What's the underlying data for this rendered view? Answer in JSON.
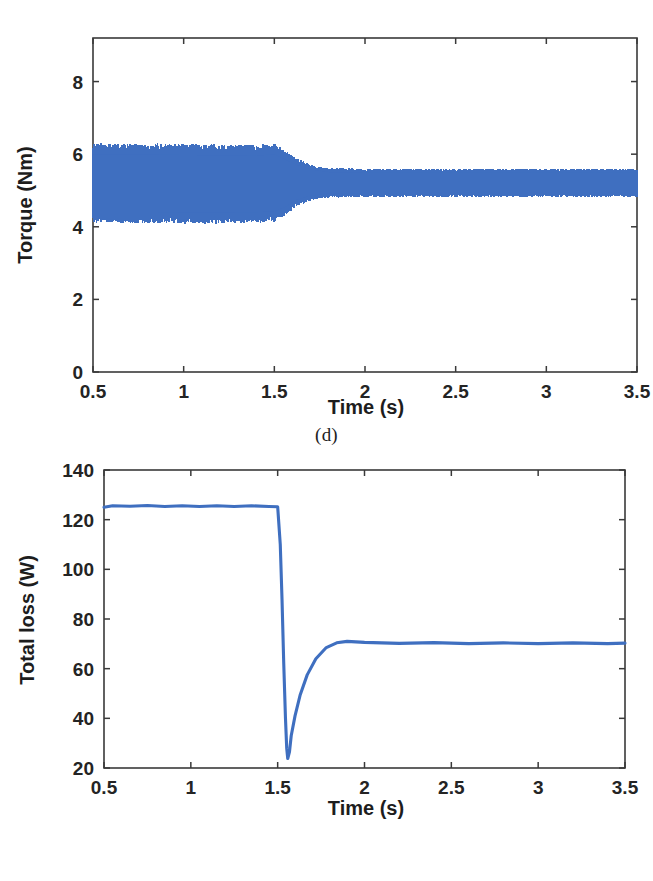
{
  "figure": {
    "background": "#ffffff",
    "series_color": "#3f6fc0",
    "axis_color": "#3a3a3a",
    "panels": [
      {
        "id": "d",
        "caption": "(d)"
      },
      {
        "id": "e",
        "caption": "(e)"
      }
    ]
  },
  "chart_data": [
    {
      "type": "line",
      "id": "torque-vs-time",
      "caption": "(d)",
      "title": "",
      "xlabel": "Time (s)",
      "ylabel": "Torque (Nm)",
      "xlim": [
        0.5,
        3.5
      ],
      "ylim": [
        0,
        9.2
      ],
      "xticks": [
        0.5,
        1,
        1.5,
        2,
        2.5,
        3,
        3.5
      ],
      "xticklabels": [
        "0.5",
        "1",
        "1.5",
        "2",
        "2.5",
        "3",
        "3.5"
      ],
      "yticks": [
        0,
        2,
        4,
        6,
        8
      ],
      "yticklabels": [
        "0",
        "2",
        "4",
        "6",
        "8"
      ],
      "grid": false,
      "legend": null,
      "description": "High-frequency torque ripple band. Before t=1.5 s the ripple spans about 4.1 to 6.3 Nm about a 5.2 Nm mean; after t=1.5 s the band contracts to roughly 4.8 to 5.6 Nm about a 5.2 Nm mean.",
      "series": [
        {
          "name": "Torque",
          "mean": 5.2,
          "envelope": [
            {
              "t": 0.5,
              "low": 4.1,
              "high": 6.3
            },
            {
              "t": 0.8,
              "low": 4.1,
              "high": 6.3
            },
            {
              "t": 1.1,
              "low": 4.08,
              "high": 6.28
            },
            {
              "t": 1.4,
              "low": 4.1,
              "high": 6.26
            },
            {
              "t": 1.5,
              "low": 4.12,
              "high": 6.3
            },
            {
              "t": 1.56,
              "low": 4.3,
              "high": 6.1
            },
            {
              "t": 1.62,
              "low": 4.55,
              "high": 5.9
            },
            {
              "t": 1.7,
              "low": 4.72,
              "high": 5.72
            },
            {
              "t": 1.8,
              "low": 4.8,
              "high": 5.62
            },
            {
              "t": 2.0,
              "low": 4.82,
              "high": 5.6
            },
            {
              "t": 2.5,
              "low": 4.82,
              "high": 5.6
            },
            {
              "t": 3.0,
              "low": 4.82,
              "high": 5.6
            },
            {
              "t": 3.5,
              "low": 4.82,
              "high": 5.6
            }
          ]
        }
      ]
    },
    {
      "type": "line",
      "id": "total-loss-vs-time",
      "caption": "(e)",
      "title": "",
      "xlabel": "Time (s)",
      "ylabel": "Total loss (W)",
      "xlim": [
        0.5,
        3.5
      ],
      "ylim": [
        20,
        140
      ],
      "xticks": [
        0.5,
        1,
        1.5,
        2,
        2.5,
        3,
        3.5
      ],
      "xticklabels": [
        "0.5",
        "1",
        "1.5",
        "2",
        "2.5",
        "3",
        "3.5"
      ],
      "yticks": [
        20,
        40,
        60,
        80,
        100,
        120,
        140
      ],
      "yticklabels": [
        "20",
        "40",
        "60",
        "80",
        "100",
        "120",
        "140"
      ],
      "grid": false,
      "legend": null,
      "description": "Total loss holds near 125.5 W until t=1.5 s, drops steeply to a minimum of about 24 W at t=1.56 s, recovers to roughly 70 W by t=1.85 s and then stays flat near 70 W.",
      "series": [
        {
          "name": "Total loss",
          "points": [
            {
              "t": 0.5,
              "v": 125.0
            },
            {
              "t": 0.55,
              "v": 125.6
            },
            {
              "t": 0.65,
              "v": 125.4
            },
            {
              "t": 0.75,
              "v": 125.7
            },
            {
              "t": 0.85,
              "v": 125.3
            },
            {
              "t": 0.95,
              "v": 125.6
            },
            {
              "t": 1.05,
              "v": 125.3
            },
            {
              "t": 1.15,
              "v": 125.6
            },
            {
              "t": 1.25,
              "v": 125.3
            },
            {
              "t": 1.35,
              "v": 125.6
            },
            {
              "t": 1.45,
              "v": 125.3
            },
            {
              "t": 1.5,
              "v": 125.2
            },
            {
              "t": 1.515,
              "v": 110.0
            },
            {
              "t": 1.525,
              "v": 88.0
            },
            {
              "t": 1.535,
              "v": 62.0
            },
            {
              "t": 1.545,
              "v": 40.0
            },
            {
              "t": 1.552,
              "v": 28.0
            },
            {
              "t": 1.558,
              "v": 23.8
            },
            {
              "t": 1.568,
              "v": 26.5
            },
            {
              "t": 1.578,
              "v": 33.0
            },
            {
              "t": 1.6,
              "v": 41.0
            },
            {
              "t": 1.63,
              "v": 49.5
            },
            {
              "t": 1.67,
              "v": 57.5
            },
            {
              "t": 1.72,
              "v": 64.0
            },
            {
              "t": 1.78,
              "v": 68.5
            },
            {
              "t": 1.84,
              "v": 70.4
            },
            {
              "t": 1.9,
              "v": 71.0
            },
            {
              "t": 2.0,
              "v": 70.6
            },
            {
              "t": 2.2,
              "v": 70.2
            },
            {
              "t": 2.4,
              "v": 70.5
            },
            {
              "t": 2.6,
              "v": 70.1
            },
            {
              "t": 2.8,
              "v": 70.4
            },
            {
              "t": 3.0,
              "v": 70.1
            },
            {
              "t": 3.2,
              "v": 70.4
            },
            {
              "t": 3.4,
              "v": 70.1
            },
            {
              "t": 3.5,
              "v": 70.3
            }
          ]
        }
      ]
    }
  ]
}
